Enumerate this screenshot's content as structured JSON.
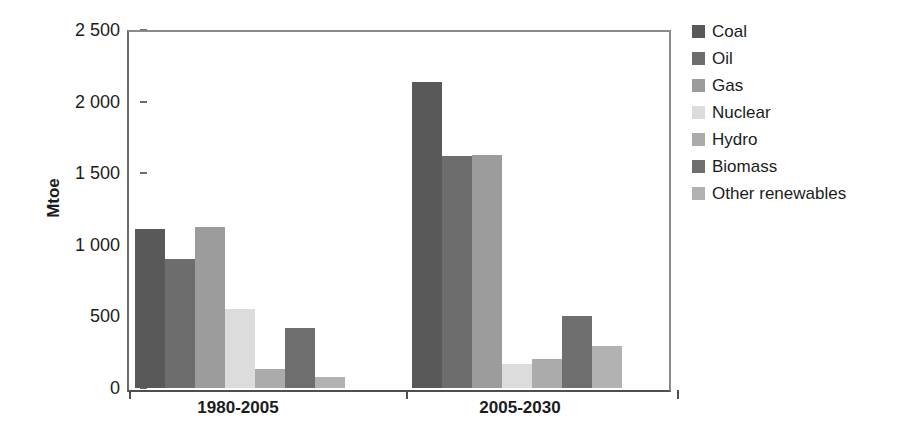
{
  "chart_data": {
    "type": "bar",
    "title": "",
    "xlabel": "",
    "ylabel": "Mtoe",
    "ylim": [
      0,
      2500
    ],
    "yticks": [
      0,
      500,
      1000,
      1500,
      2000,
      2500
    ],
    "ytick_labels": [
      "0",
      "500",
      "1 000",
      "1 500",
      "2 000",
      "2 500"
    ],
    "categories": [
      "1980-2005",
      "2005-2030"
    ],
    "grid": false,
    "legend_position": "right",
    "series": [
      {
        "name": "Coal",
        "color": "#595959",
        "values": [
          1110,
          2140
        ]
      },
      {
        "name": "Oil",
        "color": "#6d6d6d",
        "values": [
          900,
          1620
        ]
      },
      {
        "name": "Gas",
        "color": "#9c9c9c",
        "values": [
          1125,
          1625
        ]
      },
      {
        "name": "Nuclear",
        "color": "#dcdcdc",
        "values": [
          550,
          170
        ]
      },
      {
        "name": "Hydro",
        "color": "#ababab",
        "values": [
          130,
          205
        ]
      },
      {
        "name": "Biomass",
        "color": "#6e6e6e",
        "values": [
          420,
          500
        ]
      },
      {
        "name": "Other renewables",
        "color": "#b2b2b2",
        "values": [
          75,
          290
        ]
      }
    ]
  },
  "axis": {
    "ylabel": "Mtoe",
    "ytick_labels": [
      "2 500",
      "2 000",
      "1 500",
      "1 000",
      "500",
      "0"
    ],
    "xtick_labels": [
      "1980-2005",
      "2005-2030"
    ]
  },
  "legend": {
    "items": [
      {
        "label": "Coal",
        "color": "#595959"
      },
      {
        "label": "Oil",
        "color": "#6d6d6d"
      },
      {
        "label": "Gas",
        "color": "#9c9c9c"
      },
      {
        "label": "Nuclear",
        "color": "#dcdcdc"
      },
      {
        "label": "Hydro",
        "color": "#ababab"
      },
      {
        "label": "Biomass",
        "color": "#6e6e6e"
      },
      {
        "label": "Other renewables",
        "color": "#b2b2b2"
      }
    ]
  }
}
